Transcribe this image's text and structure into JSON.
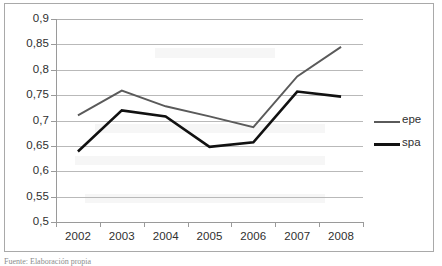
{
  "chart_data": {
    "type": "line",
    "title": "",
    "xlabel": "",
    "ylabel": "",
    "categories": [
      "2002",
      "2003",
      "2004",
      "2005",
      "2006",
      "2007",
      "2008"
    ],
    "series": [
      {
        "name": "epe",
        "color": "#5a5a5a",
        "values": [
          0.71,
          0.759,
          0.728,
          0.708,
          0.687,
          0.787,
          0.845
        ]
      },
      {
        "name": "spa",
        "color": "#111111",
        "values": [
          0.639,
          0.72,
          0.708,
          0.648,
          0.657,
          0.757,
          0.747
        ]
      }
    ],
    "ylim": [
      0.5,
      0.9
    ],
    "ytick_step": 0.05,
    "ytick_labels": [
      "0,9",
      "0,85",
      "0,8",
      "0,75",
      "0,7",
      "0,65",
      "0,6",
      "0,55",
      "0,5"
    ],
    "ytick_values": [
      0.9,
      0.85,
      0.8,
      0.75,
      0.7,
      0.65,
      0.6,
      0.55,
      0.5
    ],
    "grid": true,
    "legend_position": "right",
    "decimal_separator": ","
  },
  "legend": {
    "items": [
      {
        "label": "epe",
        "color": "#5a5a5a"
      },
      {
        "label": "spa",
        "color": "#111111"
      }
    ]
  },
  "caption": {
    "text": "Fuente: Elaboración propia"
  }
}
